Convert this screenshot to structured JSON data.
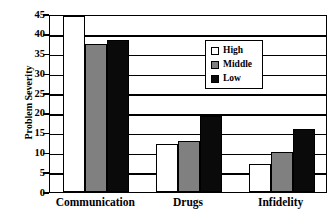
{
  "chart_data": {
    "type": "bar",
    "title": "",
    "xlabel": "",
    "ylabel": "Problem Severity",
    "categories": [
      "Communication",
      "Drugs",
      "Infidelity"
    ],
    "series": [
      {
        "name": "High",
        "color": "#ffffff",
        "values": [
          44.5,
          12.2,
          7.0
        ]
      },
      {
        "name": "Middle",
        "color": "#808080",
        "values": [
          37.5,
          13.0,
          10.0
        ]
      },
      {
        "name": "Low",
        "color": "#0a0a0a",
        "values": [
          38.5,
          19.2,
          16.0
        ]
      }
    ],
    "ylim": [
      0,
      45
    ],
    "yticks": [
      0,
      5,
      10,
      15,
      20,
      25,
      30,
      35,
      40,
      45
    ],
    "ytick_labels": [
      "0",
      "5",
      "10",
      "15",
      "20",
      "25",
      "30",
      "35",
      "40",
      "45"
    ],
    "grid": true,
    "grid_axis": "y",
    "legend_position": "upper-right-inside",
    "bar_edge_color": "#000000",
    "axis_color": "#000000",
    "background": "#ffffff"
  },
  "legend": {
    "items": [
      {
        "label": "High",
        "swatch": "high"
      },
      {
        "label": "Middle",
        "swatch": "middle"
      },
      {
        "label": "Low",
        "swatch": "low"
      }
    ]
  }
}
